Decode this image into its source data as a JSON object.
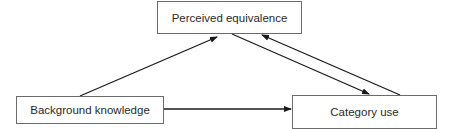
{
  "diagram": {
    "nodes": [
      {
        "id": "perceived",
        "label": "Perceived equivalence"
      },
      {
        "id": "background",
        "label": "Background knowledge"
      },
      {
        "id": "category",
        "label": "Category use"
      }
    ],
    "edges": [
      {
        "from": "background",
        "to": "perceived"
      },
      {
        "from": "perceived",
        "to": "category"
      },
      {
        "from": "category",
        "to": "perceived"
      },
      {
        "from": "background",
        "to": "category"
      }
    ],
    "colors": {
      "line": "#1a1a1a",
      "border": "#6b6b6b",
      "text": "#2a2a2a"
    }
  }
}
